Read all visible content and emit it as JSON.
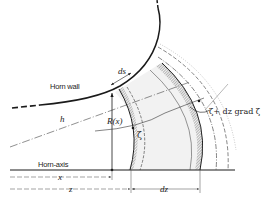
{
  "diagram": {
    "labels": {
      "horn_wall": "Horn wall",
      "horn_axis": "Horn-axis",
      "ds": "ds",
      "h": "h",
      "R_x": "R(x)",
      "zeta": "ζ",
      "zeta_plus": "ζ+ dz grad ζ",
      "x": "x",
      "z": "z",
      "dz": "dz"
    },
    "elements": [
      {
        "id": "horn-wall-curve",
        "style": "solid thick with dashed extensions"
      },
      {
        "id": "horn-axis-line",
        "style": "solid"
      },
      {
        "id": "wavefront-zeta",
        "style": "solid with hatched shading"
      },
      {
        "id": "wavefront-zeta-plus-dz",
        "style": "solid with hatched shading"
      },
      {
        "id": "outer-wavefronts",
        "style": "dash-dot / dashed"
      },
      {
        "id": "h-line",
        "style": "dash-dot through origin"
      },
      {
        "id": "radius-R",
        "style": "vertical line with arrow"
      },
      {
        "id": "dimension-x",
        "style": "arrow"
      },
      {
        "id": "dimension-z",
        "style": "arrow"
      },
      {
        "id": "dimension-dz",
        "style": "double arrow"
      }
    ],
    "colors": {
      "ink": "#1a1a1a",
      "hatch": "#555555",
      "shade": "#ededed"
    }
  }
}
